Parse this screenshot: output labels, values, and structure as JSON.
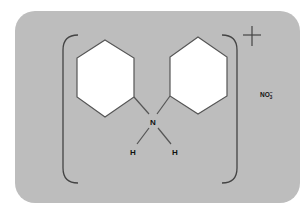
{
  "diagram": {
    "colors": {
      "panel": "#bdbdbd",
      "ring_fill": "#ffffff",
      "stroke": "#555555",
      "text": "#111111"
    },
    "atoms": {
      "nitrogen": "N",
      "hydrogen_left": "H",
      "hydrogen_right": "H"
    },
    "charge": "+",
    "counter_ion": {
      "base": "NO",
      "subscript": "3",
      "superscript": "−"
    },
    "rings": [
      {
        "name": "phenyl-left"
      },
      {
        "name": "phenyl-right"
      }
    ]
  }
}
